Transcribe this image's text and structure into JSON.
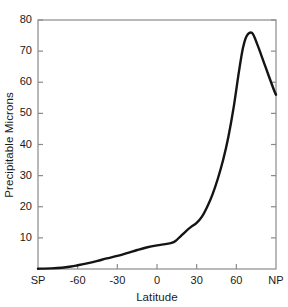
{
  "chart_data": {
    "type": "line",
    "title": "",
    "xlabel": "Latitude",
    "ylabel": "Precipitable Microns",
    "xlim": [
      -90,
      90
    ],
    "ylim": [
      0,
      80
    ],
    "grid": false,
    "legend": null,
    "xtick_values": [
      -90,
      -60,
      -30,
      0,
      30,
      60,
      90
    ],
    "xtick_labels": [
      "SP",
      "-60",
      "-30",
      "0",
      "30",
      "60",
      "NP"
    ],
    "ytick_values": [
      0,
      10,
      20,
      30,
      40,
      50,
      60,
      70,
      80
    ],
    "ytick_labels": [
      "0",
      "10",
      "20",
      "30",
      "40",
      "50",
      "60",
      "70",
      "80"
    ],
    "series": [
      {
        "name": "Precipitable water vapor",
        "x": [
          -90,
          -80,
          -72,
          -65,
          -60,
          -52,
          -45,
          -38,
          -30,
          -22,
          -15,
          -8,
          0,
          6,
          11,
          14,
          18,
          22,
          26,
          30,
          34,
          38,
          42,
          46,
          50,
          54,
          58,
          62,
          65,
          68,
          72,
          76,
          82,
          88,
          90
        ],
        "y": [
          0.1,
          0.2,
          0.4,
          0.8,
          1.2,
          1.9,
          2.6,
          3.4,
          4.2,
          5.2,
          6.1,
          6.9,
          7.6,
          8.0,
          8.4,
          9.0,
          10.6,
          12.2,
          13.6,
          14.8,
          16.8,
          20.0,
          24.0,
          29.0,
          35.0,
          42.5,
          52.0,
          63.5,
          71.0,
          75.0,
          75.8,
          72.0,
          65.0,
          58.0,
          56.0
        ]
      }
    ]
  },
  "ytick_label_0": "0",
  "ytick_label_1": "10",
  "ytick_label_2": "20",
  "ytick_label_3": "30",
  "ytick_label_4": "40",
  "ytick_label_5": "50",
  "ytick_label_6": "60",
  "ytick_label_7": "70",
  "ytick_label_8": "80",
  "xtick_label_0": "SP",
  "xtick_label_1": "-60",
  "xtick_label_2": "-30",
  "xtick_label_3": "0",
  "xtick_label_4": "30",
  "xtick_label_5": "60",
  "xtick_label_6": "NP"
}
